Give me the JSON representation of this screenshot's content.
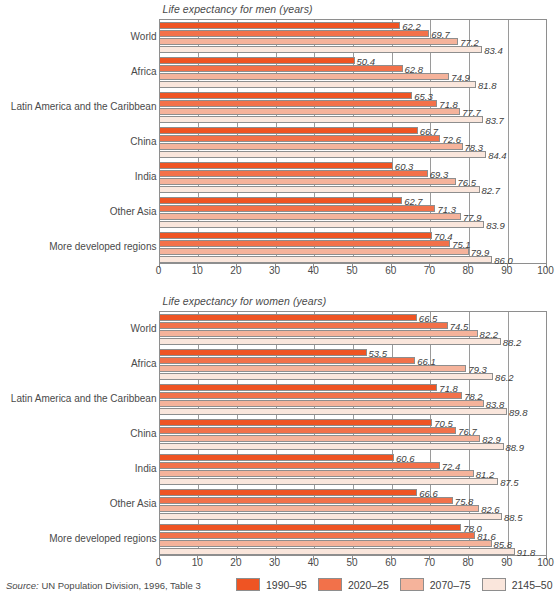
{
  "source": {
    "prefix": "Source:",
    "text": " UN Population Division, 1996, Table 3"
  },
  "legend": {
    "items": [
      {
        "label": "1990–95",
        "color": "#ef5423"
      },
      {
        "label": "2020–25",
        "color": "#f2714a"
      },
      {
        "label": "2070–75",
        "color": "#f5b39b"
      },
      {
        "label": "2145–50",
        "color": "#fae6dc"
      }
    ]
  },
  "axis": {
    "ticks": [
      "0",
      "10",
      "20",
      "30",
      "40",
      "50",
      "60",
      "70",
      "80",
      "90",
      "100"
    ],
    "min": 0,
    "max": 100
  },
  "chart_data": [
    {
      "type": "bar",
      "orientation": "horizontal",
      "title": "Life expectancy for men (years)",
      "xlabel": "",
      "ylabel": "",
      "xlim": [
        0,
        100
      ],
      "grid": true,
      "legend_position": "bottom",
      "categories": [
        "World",
        "Africa",
        "Latin America and the Caribbean",
        "China",
        "India",
        "Other Asia",
        "More developed regions"
      ],
      "series": [
        {
          "name": "1990–95",
          "color": "#ef5423",
          "values": [
            62.2,
            50.4,
            65.3,
            66.7,
            60.3,
            62.7,
            70.4
          ]
        },
        {
          "name": "2020–25",
          "color": "#f2714a",
          "values": [
            69.7,
            62.8,
            71.8,
            72.6,
            69.3,
            71.3,
            75.1
          ]
        },
        {
          "name": "2070–75",
          "color": "#f5b39b",
          "values": [
            77.2,
            74.9,
            77.7,
            78.3,
            76.5,
            77.9,
            79.9
          ]
        },
        {
          "name": "2145–50",
          "color": "#fae6dc",
          "values": [
            83.4,
            81.8,
            83.7,
            84.4,
            82.7,
            83.9,
            86.0
          ]
        }
      ]
    },
    {
      "type": "bar",
      "orientation": "horizontal",
      "title": "Life expectancy for women (years)",
      "xlabel": "",
      "ylabel": "",
      "xlim": [
        0,
        100
      ],
      "grid": true,
      "legend_position": "bottom",
      "categories": [
        "World",
        "Africa",
        "Latin America and the Caribbean",
        "China",
        "India",
        "Other Asia",
        "More developed regions"
      ],
      "series": [
        {
          "name": "1990–95",
          "color": "#ef5423",
          "values": [
            66.5,
            53.5,
            71.8,
            70.5,
            60.6,
            66.6,
            78.0
          ]
        },
        {
          "name": "2020–25",
          "color": "#f2714a",
          "values": [
            74.5,
            66.1,
            78.2,
            76.7,
            72.4,
            75.8,
            81.6
          ]
        },
        {
          "name": "2070–75",
          "color": "#f5b39b",
          "values": [
            82.2,
            79.3,
            83.8,
            82.9,
            81.2,
            82.6,
            85.8
          ]
        },
        {
          "name": "2145–50",
          "color": "#fae6dc",
          "values": [
            88.2,
            86.2,
            89.8,
            88.9,
            87.5,
            88.5,
            91.8
          ]
        }
      ]
    }
  ]
}
